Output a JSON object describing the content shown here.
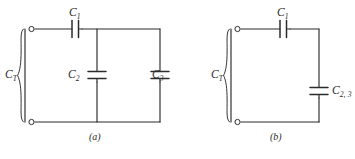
{
  "figure": {
    "type": "circuit-diagram",
    "background_color": "#ffffff",
    "line_color": "#2b2b2b",
    "text_color": "#2b2b2b"
  },
  "panel_a": {
    "caption": "(a)",
    "description": "C1 in series with parallel combination of C2 and C3 across terminals CT",
    "labels": {
      "total": {
        "base": "C",
        "sub": "T"
      },
      "c1": {
        "base": "C",
        "sub": "1"
      },
      "c2": {
        "base": "C",
        "sub": "2"
      },
      "c3": {
        "base": "C",
        "sub": "3"
      }
    }
  },
  "panel_b": {
    "caption": "(b)",
    "description": "C1 in series with equivalent capacitor C2,3 across terminals CT",
    "labels": {
      "total": {
        "base": "C",
        "sub": "T"
      },
      "c1": {
        "base": "C",
        "sub": "1"
      },
      "c23": {
        "base": "C",
        "sub": "2, 3"
      }
    }
  }
}
